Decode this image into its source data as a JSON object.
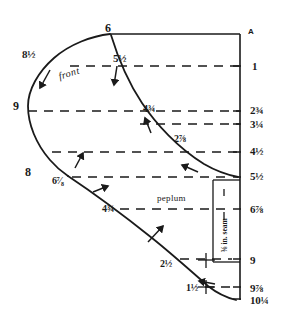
{
  "diagram": {
    "title_letter": "A",
    "section_label": "front",
    "peplum_label": "peplum",
    "seam_label": "⅜ in. seam",
    "stroke_color": "#1a1a1a",
    "background_color": "#ffffff",
    "right_scale": [
      {
        "value": "1",
        "x": 252,
        "y": 61,
        "tick_y": 66
      },
      {
        "value": "2¾",
        "x": 250,
        "y": 105,
        "tick_y": 111
      },
      {
        "value": "3¼",
        "x": 250,
        "y": 119,
        "tick_y": 124
      },
      {
        "value": "4½",
        "x": 250,
        "y": 146,
        "tick_y": 152
      },
      {
        "value": "5½",
        "x": 250,
        "y": 171,
        "tick_y": 177
      },
      {
        "value": "6⅞",
        "x": 250,
        "y": 204,
        "tick_y": 209
      },
      {
        "value": "9",
        "x": 250,
        "y": 255,
        "tick_y": 259
      },
      {
        "value": "9⅞",
        "x": 250,
        "y": 283,
        "tick_y": 287
      },
      {
        "value": "10¼",
        "x": 250,
        "y": 295,
        "tick_y": 299
      }
    ],
    "curve_labels": [
      {
        "value": "6",
        "x": 105,
        "y": 22,
        "size": "lg"
      },
      {
        "value": "8½",
        "x": 22,
        "y": 49,
        "size": "md"
      },
      {
        "value": "5½",
        "x": 113,
        "y": 53,
        "size": "md"
      },
      {
        "value": "9",
        "x": 13,
        "y": 100,
        "size": "lg"
      },
      {
        "value": "4¾",
        "x": 143,
        "y": 104,
        "size": "sm"
      },
      {
        "value": "2⅞",
        "x": 174,
        "y": 134,
        "size": "sm"
      },
      {
        "value": "8",
        "x": 25,
        "y": 166,
        "size": "lg"
      },
      {
        "value": "6⁷⁄₈",
        "x": 52,
        "y": 176,
        "size": "sm"
      },
      {
        "value": "4¾",
        "x": 102,
        "y": 204,
        "size": "sm"
      },
      {
        "value": "2½",
        "x": 160,
        "y": 259,
        "size": "sm"
      },
      {
        "value": "1½",
        "x": 186,
        "y": 283,
        "size": "sm"
      }
    ],
    "dashed_lines": [
      {
        "name": "guide-1",
        "x1": 70,
        "y1": 66,
        "x2": 240,
        "y2": 66
      },
      {
        "name": "guide-2",
        "x1": 28,
        "y1": 111,
        "x2": 240,
        "y2": 111
      },
      {
        "name": "guide-3",
        "x1": 140,
        "y1": 124,
        "x2": 240,
        "y2": 124
      },
      {
        "name": "guide-4",
        "x1": 52,
        "y1": 152,
        "x2": 240,
        "y2": 152
      },
      {
        "name": "guide-5",
        "x1": 72,
        "y1": 177,
        "x2": 232,
        "y2": 177
      },
      {
        "name": "guide-6",
        "x1": 120,
        "y1": 209,
        "x2": 232,
        "y2": 209
      },
      {
        "name": "guide-7",
        "x1": 180,
        "y1": 259,
        "x2": 232,
        "y2": 259
      },
      {
        "name": "guide-8",
        "x1": 205,
        "y1": 287,
        "x2": 232,
        "y2": 287
      }
    ],
    "arrows": [
      {
        "name": "arrow-front-left",
        "x1": 50,
        "y1": 70,
        "x2": 40,
        "y2": 88
      },
      {
        "name": "arrow-front-mid",
        "x1": 117,
        "y1": 66,
        "x2": 114,
        "y2": 85
      },
      {
        "name": "arrow-side-upper",
        "x1": 151,
        "y1": 133,
        "x2": 145,
        "y2": 118
      },
      {
        "name": "arrow-side-lower",
        "x1": 198,
        "y1": 172,
        "x2": 182,
        "y2": 165
      },
      {
        "name": "arrow-peplum-top",
        "x1": 75,
        "y1": 168,
        "x2": 83,
        "y2": 153
      },
      {
        "name": "arrow-peplum-mid",
        "x1": 93,
        "y1": 192,
        "x2": 108,
        "y2": 186
      },
      {
        "name": "arrow-peplum-low",
        "x1": 148,
        "y1": 242,
        "x2": 163,
        "y2": 226
      },
      {
        "name": "arrow-bottom",
        "x1": 215,
        "y1": 284,
        "x2": 199,
        "y2": 281
      }
    ]
  }
}
